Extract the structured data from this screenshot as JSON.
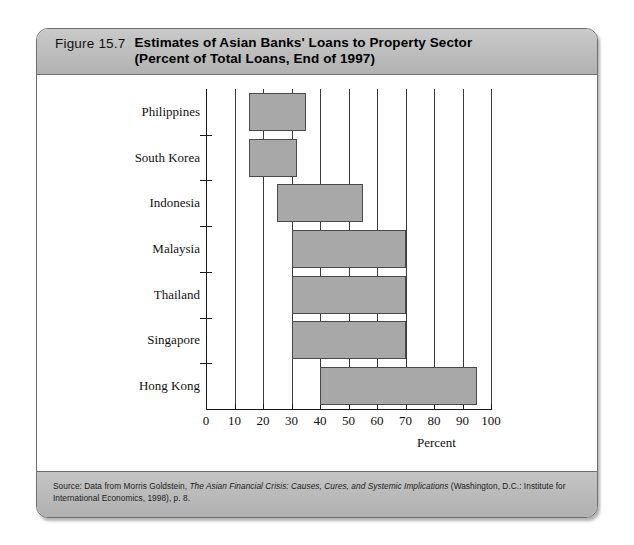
{
  "figure": {
    "number": "Figure 15.7",
    "title_line1": "Estimates of Asian Banks' Loans to Property Sector",
    "title_line2": "(Percent of Total Loans, End of 1997)",
    "source_prefix": "Source: Data from Morris Goldstein, ",
    "source_italic": "The Asian Financial Crisis: Causes, Cures, and Systemic Implications",
    "source_suffix": " (Washington, D.C.: Institute for International Economics, 1998), p. 8."
  },
  "colors": {
    "band": "#b8b8b8",
    "bar_fill": "#a8a8a8",
    "bar_stroke": "#4a4a4a",
    "grid": "#3a3a3a",
    "axis": "#1a1a1a"
  },
  "chart_data": {
    "type": "bar",
    "orientation": "horizontal",
    "range_bars": true,
    "title": "Estimates of Asian Banks' Loans to Property Sector (Percent of Total Loans, End of 1997)",
    "xlabel": "Percent",
    "ylabel": "",
    "xlim": [
      0,
      100
    ],
    "xticks": [
      0,
      10,
      20,
      30,
      40,
      50,
      60,
      70,
      80,
      90,
      100
    ],
    "xtick_labels": [
      "0",
      "10",
      "20",
      "30",
      "40",
      "50",
      "60",
      "70",
      "80",
      "90",
      "100"
    ],
    "grid": true,
    "grid_axis": "x",
    "legend": false,
    "categories": [
      "Philippines",
      "South Korea",
      "Indonesia",
      "Malaysia",
      "Thailand",
      "Singapore",
      "Hong Kong"
    ],
    "low": [
      15,
      15,
      25,
      30,
      30,
      30,
      40
    ],
    "high": [
      35,
      32,
      55,
      70,
      70,
      70,
      95
    ],
    "points": [
      {
        "category": "Philippines",
        "low": 15,
        "high": 35
      },
      {
        "category": "South Korea",
        "low": 15,
        "high": 32
      },
      {
        "category": "Indonesia",
        "low": 25,
        "high": 55
      },
      {
        "category": "Malaysia",
        "low": 30,
        "high": 70
      },
      {
        "category": "Thailand",
        "low": 30,
        "high": 70
      },
      {
        "category": "Singapore",
        "low": 30,
        "high": 70
      },
      {
        "category": "Hong Kong",
        "low": 40,
        "high": 95
      }
    ]
  }
}
